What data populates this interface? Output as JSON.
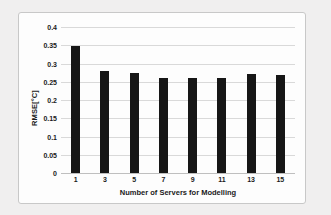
{
  "chart_data": {
    "type": "bar",
    "title": "",
    "categories": [
      "1",
      "3",
      "5",
      "7",
      "9",
      "11",
      "13",
      "15"
    ],
    "values": [
      0.348,
      0.279,
      0.273,
      0.259,
      0.261,
      0.26,
      0.271,
      0.268
    ],
    "xlabel": "Number of Servers for Modelling",
    "ylabel": "RMSE[°C]",
    "ylim": [
      0,
      0.4
    ],
    "ytick_labels": [
      "0.4",
      "0.35",
      "0.3",
      "0.25",
      "0.2",
      "0.15",
      "0.1",
      "0.05",
      "0"
    ],
    "ytick_values": [
      0.4,
      0.35,
      0.3,
      0.25,
      0.2,
      0.15,
      0.1,
      0.05,
      0
    ],
    "grid": true,
    "legend": false,
    "bar_color": "#161616",
    "gridline_color": "#d9d9d9",
    "plot_background": "#fdfdfd"
  }
}
